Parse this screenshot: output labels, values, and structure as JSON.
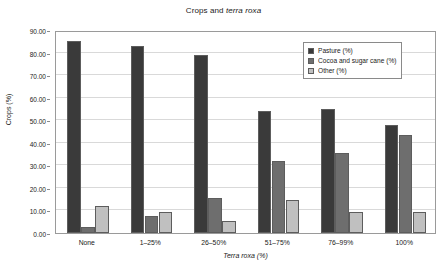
{
  "chart_data": {
    "type": "bar",
    "title": "Crops and terra roxa",
    "title_plain": "Crops and ",
    "title_italic": "terra roxa",
    "xlabel": "Terra roxa (%)",
    "ylabel": "Crops (%)",
    "ylim": [
      0,
      90
    ],
    "ytick_labels": [
      "0.00",
      "10.00",
      "20.00",
      "30.00",
      "40.00",
      "50.00",
      "60.00",
      "70.00",
      "80.00",
      "90.00"
    ],
    "ytick_values": [
      0,
      10,
      20,
      30,
      40,
      50,
      60,
      70,
      80,
      90
    ],
    "grid": true,
    "legend_position": "top-right",
    "categories": [
      "None",
      "1–25%",
      "26–50%",
      "51–75%",
      "76–99%",
      "100%"
    ],
    "series": [
      {
        "name": "Pasture (%)",
        "color": "#3a3a3a",
        "values": [
          85.0,
          83.0,
          79.0,
          54.0,
          55.0,
          48.0
        ]
      },
      {
        "name": "Cocoa and  sugar cane (%)",
        "color": "#6e6e6e",
        "values": [
          2.5,
          7.5,
          15.5,
          32.0,
          35.5,
          43.5
        ]
      },
      {
        "name": "Other (%)",
        "color": "#c0c0c0",
        "values": [
          12.0,
          9.5,
          5.5,
          14.5,
          9.5,
          9.5
        ]
      }
    ]
  }
}
